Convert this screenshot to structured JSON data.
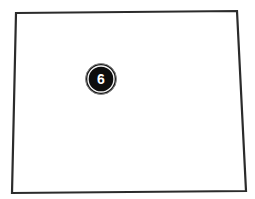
{
  "map": {
    "region": {
      "name": "state-outline",
      "corners": [
        [
          16,
          13
        ],
        [
          237,
          11
        ],
        [
          246,
          191
        ],
        [
          12,
          193
        ]
      ],
      "fill": "#ffffff",
      "stroke": "#2b2b2b"
    },
    "markers": [
      {
        "label": "6",
        "cx": 101,
        "cy": 79,
        "r": 15,
        "fill": "#0d0d0d",
        "ring_color": "#f2f2f2",
        "text_color": "#ffffff"
      }
    ]
  }
}
